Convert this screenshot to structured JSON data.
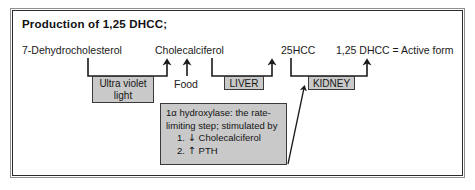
{
  "figure": {
    "title": "Production of 1,25 DHCC;",
    "background": "#ffffff",
    "box_fill": "#c9c9c9",
    "line_color": "#1a1a1a"
  },
  "pathway": {
    "metabolites": [
      {
        "id": "dehydrocholesterol",
        "label": "7-Dehydrocholesterol"
      },
      {
        "id": "cholecalciferol",
        "label": "Cholecalciferol"
      },
      {
        "id": "hcc25",
        "label": "25HCC"
      },
      {
        "id": "dhcc125",
        "label": "1,25 DHCC = Active form"
      }
    ],
    "conversions": [
      {
        "id": "uv",
        "label": "Ultra violet light",
        "boxed": true
      },
      {
        "id": "food",
        "label": "Food",
        "boxed": false
      },
      {
        "id": "liver",
        "label": "LIVER",
        "boxed": true
      },
      {
        "id": "kidney",
        "label": "KIDNEY",
        "boxed": true
      }
    ]
  },
  "annotation": {
    "line1": "1α hydroxylase: the rate-",
    "line2": "limiting step; stimulated by",
    "item1_number": "1.",
    "item1_arrow": "↓",
    "item1_text": "Cholecalciferol",
    "item2_number": "2.",
    "item2_arrow": "↑",
    "item2_text": "PTH"
  }
}
